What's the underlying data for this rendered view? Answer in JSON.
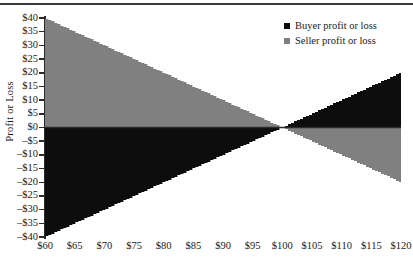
{
  "figure": {
    "ylabel": "Profit or Loss",
    "has_top_rule": true,
    "colors": {
      "buyer": "#0d0d0d",
      "seller": "#808080",
      "axis": "#2b2b2b",
      "text": "#1a1a1a",
      "background": "#ffffff"
    }
  },
  "legend": {
    "position": "top-right",
    "items": [
      {
        "label": "Buyer profit or loss",
        "color": "#0d0d0d",
        "swatch": "black-square-icon"
      },
      {
        "label": "Seller profit or loss",
        "color": "#808080",
        "swatch": "gray-square-icon"
      }
    ]
  },
  "axes": {
    "y_ticks": [
      "$40",
      "$35",
      "$30",
      "$25",
      "$20",
      "$15",
      "$10",
      "$5",
      "$0",
      "–$5",
      "–$10",
      "–$15",
      "–$20",
      "–$25",
      "–$30",
      "–$35",
      "–$40"
    ],
    "y_values": [
      40,
      35,
      30,
      25,
      20,
      15,
      10,
      5,
      0,
      -5,
      -10,
      -15,
      -20,
      -25,
      -30,
      -35,
      -40
    ],
    "x_ticks": [
      "$60",
      "$65",
      "$70",
      "$75",
      "$80",
      "$85",
      "$90",
      "$95",
      "$100",
      "$105",
      "$110",
      "$115",
      "$120"
    ],
    "x_values": [
      60,
      65,
      70,
      75,
      80,
      85,
      90,
      95,
      100,
      105,
      110,
      115,
      120
    ]
  },
  "chart_data": {
    "type": "area",
    "title": "",
    "subtitle": "",
    "xlabel": "",
    "ylabel": "Profit or Loss",
    "xlim": [
      60,
      120
    ],
    "ylim": [
      -40,
      40
    ],
    "grid": false,
    "legend_position": "top-right",
    "annotations": [],
    "strike_price": 100,
    "x": [
      60,
      65,
      70,
      75,
      80,
      85,
      90,
      95,
      100,
      105,
      110,
      115,
      120
    ],
    "series": [
      {
        "name": "Buyer profit or loss",
        "color": "#0d0d0d",
        "values": [
          -40,
          -35,
          -30,
          -25,
          -20,
          -15,
          -10,
          -5,
          0,
          5,
          10,
          15,
          20
        ]
      },
      {
        "name": "Seller profit or loss",
        "color": "#808080",
        "values": [
          40,
          35,
          30,
          25,
          20,
          15,
          10,
          5,
          0,
          -5,
          -10,
          -15,
          -20
        ]
      }
    ]
  }
}
